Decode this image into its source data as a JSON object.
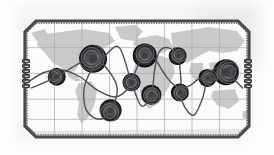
{
  "figure": {
    "kind": "world-map-route-diagram",
    "title": "",
    "background_color": "#ffffff",
    "plate": {
      "frame_color": "#4a4a4a",
      "frame_width_px": 3,
      "corner_bevel_px": 12,
      "fill_color": "#fbfbfb",
      "x": 23,
      "y": 19,
      "w": 228,
      "h": 120
    },
    "land_color": "#c9c9c9",
    "ocean_color": "#fbfbfb",
    "grid_color": "#b0a9a9",
    "route_color": "#4e4e56",
    "node_color": "#3e3e44",
    "halo_color": "#cfcfcf"
  },
  "graticule": {
    "meridians_pct": [
      12.5,
      25,
      37.5,
      50,
      62.5,
      75,
      87.5
    ],
    "parallels_pct": [
      22,
      45,
      68,
      86
    ],
    "grid_on": true
  },
  "side_connectors": {
    "left": {
      "name": "left-bead-stack",
      "count": 6
    },
    "right": {
      "name": "right-bead-stack",
      "count": 6
    }
  },
  "chart_data": {
    "type": "scatter",
    "title": "",
    "xlabel": "",
    "ylabel": "",
    "xlim": [
      0,
      100
    ],
    "ylim": [
      0,
      100
    ],
    "grid": true,
    "legend": "none",
    "nodes": [
      {
        "id": "n1",
        "x": 13.5,
        "y": 48.0,
        "size": "small",
        "halo": true
      },
      {
        "id": "n2",
        "x": 30.0,
        "y": 32.0,
        "size": "large",
        "halo": true
      },
      {
        "id": "n3",
        "x": 38.0,
        "y": 78.0,
        "size": "medium",
        "halo": true
      },
      {
        "id": "n4",
        "x": 47.5,
        "y": 53.0,
        "size": "small",
        "halo": true
      },
      {
        "id": "n5",
        "x": 53.5,
        "y": 29.0,
        "size": "medium",
        "halo": true
      },
      {
        "id": "n6",
        "x": 56.5,
        "y": 64.0,
        "size": "small",
        "halo": true
      },
      {
        "id": "n7",
        "x": 68.5,
        "y": 29.5,
        "size": "small",
        "halo": true
      },
      {
        "id": "n8",
        "x": 69.5,
        "y": 62.0,
        "size": "small",
        "halo": true
      },
      {
        "id": "n9",
        "x": 82.0,
        "y": 49.0,
        "size": "small",
        "halo": true
      },
      {
        "id": "n10",
        "x": 90.5,
        "y": 44.0,
        "size": "large",
        "halo": true
      }
    ],
    "series": [
      {
        "name": "route-a",
        "kind": "smooth-curve",
        "points": [
          [
            2,
            58
          ],
          [
            13.5,
            48
          ],
          [
            22,
            38
          ],
          [
            30,
            32
          ],
          [
            36,
            40
          ],
          [
            41,
            58
          ],
          [
            38,
            78
          ],
          [
            33,
            86
          ],
          [
            27,
            78
          ],
          [
            26,
            58
          ],
          [
            30,
            40
          ],
          [
            36,
            28
          ],
          [
            42,
            22
          ],
          [
            47.5,
            53
          ],
          [
            52,
            74
          ],
          [
            56.5,
            64
          ],
          [
            58,
            42
          ],
          [
            60,
            26
          ],
          [
            64,
            22
          ],
          [
            68.5,
            29.5
          ],
          [
            70,
            52
          ],
          [
            69.5,
            62
          ],
          [
            72,
            76
          ],
          [
            76,
            82
          ],
          [
            80,
            66
          ],
          [
            82,
            49
          ],
          [
            86,
            40
          ],
          [
            90.5,
            44
          ],
          [
            95,
            52
          ],
          [
            98,
            58
          ]
        ]
      },
      {
        "name": "route-b",
        "kind": "smooth-curve",
        "points": [
          [
            1,
            52
          ],
          [
            8,
            44
          ],
          [
            16,
            42
          ],
          [
            24,
            48
          ],
          [
            32,
            60
          ],
          [
            40,
            66
          ],
          [
            46,
            58
          ],
          [
            50,
            40
          ],
          [
            53.5,
            29
          ],
          [
            58,
            32
          ],
          [
            62,
            44
          ],
          [
            66,
            54
          ],
          [
            70,
            58
          ],
          [
            74,
            56
          ],
          [
            78,
            50
          ],
          [
            82,
            49
          ],
          [
            86,
            50
          ],
          [
            90.5,
            44
          ],
          [
            96,
            40
          ]
        ]
      }
    ]
  }
}
